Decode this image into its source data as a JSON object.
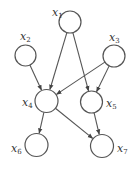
{
  "diagram": {
    "type": "directed-acyclic-graph",
    "nodes": [
      {
        "id": "x1",
        "label": "x",
        "sub": "1",
        "cx": 70,
        "cy": 22,
        "r": 11,
        "lx": 52,
        "ly": 16
      },
      {
        "id": "x2",
        "label": "x",
        "sub": "2",
        "cx": 25.5,
        "cy": 55.5,
        "r": 10.5,
        "lx": 20,
        "ly": 40
      },
      {
        "id": "x3",
        "label": "x",
        "sub": "3",
        "cx": 114,
        "cy": 56,
        "r": 11,
        "lx": 109,
        "ly": 41
      },
      {
        "id": "x4",
        "label": "x",
        "sub": "4",
        "cx": 46.5,
        "cy": 101,
        "r": 11.5,
        "lx": 22,
        "ly": 106
      },
      {
        "id": "x5",
        "label": "x",
        "sub": "5",
        "cx": 91.5,
        "cy": 102,
        "r": 11,
        "lx": 106,
        "ly": 107
      },
      {
        "id": "x6",
        "label": "x",
        "sub": "6",
        "cx": 36.5,
        "cy": 145,
        "r": 11.5,
        "lx": 11,
        "ly": 152
      },
      {
        "id": "x7",
        "label": "x",
        "sub": "7",
        "cx": 102,
        "cy": 146,
        "r": 11.5,
        "lx": 117,
        "ly": 152
      }
    ],
    "edges": [
      {
        "from": "x1",
        "to": "x4"
      },
      {
        "from": "x1",
        "to": "x5"
      },
      {
        "from": "x2",
        "to": "x4"
      },
      {
        "from": "x3",
        "to": "x4"
      },
      {
        "from": "x3",
        "to": "x5"
      },
      {
        "from": "x4",
        "to": "x6"
      },
      {
        "from": "x4",
        "to": "x7"
      },
      {
        "from": "x5",
        "to": "x7"
      }
    ]
  }
}
